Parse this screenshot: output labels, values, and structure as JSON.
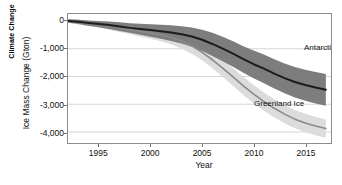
{
  "heading": {
    "text": "Climate Change"
  },
  "chart_data": {
    "type": "line",
    "title": "",
    "xlabel": "Year",
    "ylabel": "Ice Mass Change (Gton)",
    "xlim": [
      1992,
      2017.5
    ],
    "ylim": [
      -4400,
      250
    ],
    "grid": true,
    "legend_position": "inline-annotations",
    "xticks": [
      1995,
      2000,
      2005,
      2010,
      2015
    ],
    "xtick_labels": [
      "1995",
      "2000",
      "2005",
      "2010",
      "2015"
    ],
    "yticks": [
      0,
      -1000,
      -2000,
      -3000,
      -4000
    ],
    "ytick_labels": [
      "0",
      "-1,000",
      "-2,000",
      "-3,000",
      "-4,000"
    ],
    "series": [
      {
        "name": "Antarctic Ice",
        "color": "#1c1c1c",
        "band_color": "#7d7d7d",
        "x": [
          1992,
          1993,
          1994,
          1995,
          1996,
          1997,
          1998,
          1999,
          2000,
          2001,
          2002,
          2003,
          2004,
          2005,
          2006,
          2007,
          2008,
          2009,
          2010,
          2011,
          2012,
          2013,
          2014,
          2015,
          2016,
          2017
        ],
        "values": [
          0,
          -30,
          -70,
          -110,
          -150,
          -200,
          -250,
          -290,
          -330,
          -370,
          -420,
          -480,
          -560,
          -680,
          -830,
          -1000,
          -1180,
          -1380,
          -1560,
          -1720,
          -1900,
          -2060,
          -2200,
          -2310,
          -2400,
          -2480
        ],
        "band_low": [
          -60,
          -110,
          -170,
          -230,
          -290,
          -360,
          -430,
          -500,
          -570,
          -640,
          -720,
          -810,
          -930,
          -1080,
          -1260,
          -1450,
          -1650,
          -1870,
          -2070,
          -2250,
          -2440,
          -2610,
          -2760,
          -2880,
          -2980,
          -3060
        ],
        "band_high": [
          60,
          40,
          20,
          0,
          -20,
          -50,
          -80,
          -100,
          -120,
          -140,
          -160,
          -190,
          -240,
          -320,
          -430,
          -570,
          -730,
          -910,
          -1070,
          -1210,
          -1380,
          -1530,
          -1660,
          -1760,
          -1840,
          -1910
        ]
      },
      {
        "name": "Greenland Ice",
        "color": "#8a8a8a",
        "band_color": "#dcdcdc",
        "x": [
          1992,
          1993,
          1994,
          1995,
          1996,
          1997,
          1998,
          1999,
          2000,
          2001,
          2002,
          2003,
          2004,
          2005,
          2006,
          2007,
          2008,
          2009,
          2010,
          2011,
          2012,
          2013,
          2014,
          2015,
          2016,
          2017
        ],
        "values": [
          0,
          -40,
          -90,
          -140,
          -190,
          -250,
          -310,
          -370,
          -430,
          -500,
          -590,
          -720,
          -900,
          -1130,
          -1400,
          -1700,
          -2020,
          -2340,
          -2640,
          -2910,
          -3150,
          -3360,
          -3540,
          -3680,
          -3790,
          -3880
        ],
        "band_low": [
          -70,
          -130,
          -190,
          -250,
          -320,
          -400,
          -480,
          -560,
          -640,
          -730,
          -840,
          -990,
          -1180,
          -1420,
          -1700,
          -2010,
          -2340,
          -2670,
          -2970,
          -3240,
          -3480,
          -3690,
          -3870,
          -4010,
          -4120,
          -4210
        ],
        "band_high": [
          70,
          50,
          10,
          -30,
          -70,
          -110,
          -150,
          -190,
          -230,
          -280,
          -350,
          -460,
          -620,
          -830,
          -1090,
          -1380,
          -1700,
          -2010,
          -2310,
          -2580,
          -2820,
          -3030,
          -3210,
          -3350,
          -3460,
          -3550
        ]
      }
    ],
    "annotations": [
      {
        "text": "Antarctic Ice",
        "series": "Antarctic Ice"
      },
      {
        "text": "Greenland Ice",
        "series": "Greenland Ice"
      }
    ]
  }
}
